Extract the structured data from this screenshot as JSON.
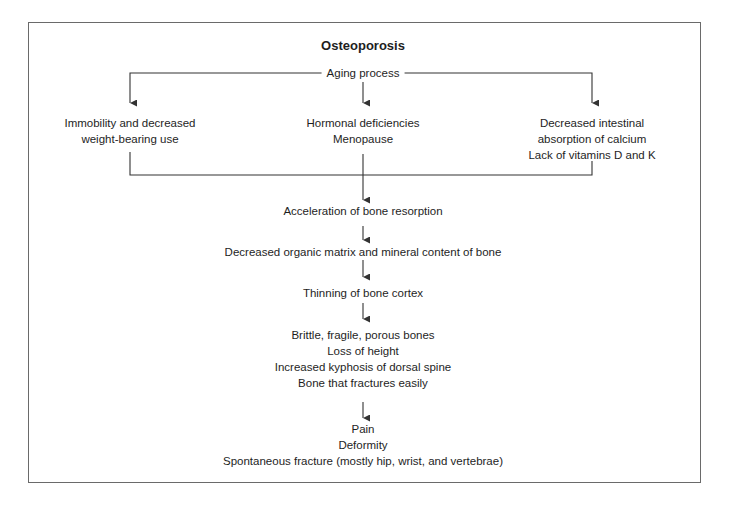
{
  "diagram": {
    "title": "Osteoporosis",
    "root": "Aging process",
    "causes": [
      {
        "lines": [
          "Immobility and decreased",
          "weight-bearing use"
        ]
      },
      {
        "lines": [
          "Hormonal deficiencies",
          "Menopause"
        ]
      },
      {
        "lines": [
          "Decreased intestinal",
          "absorption of calcium",
          "Lack of vitamins D and K"
        ]
      }
    ],
    "chain": [
      {
        "lines": [
          "Acceleration of bone resorption"
        ]
      },
      {
        "lines": [
          "Decreased organic matrix and mineral content of bone"
        ]
      },
      {
        "lines": [
          "Thinning of bone cortex"
        ]
      },
      {
        "lines": [
          "Brittle, fragile, porous bones",
          "Loss of height",
          "Increased kyphosis of dorsal spine",
          "Bone that fractures easily"
        ]
      },
      {
        "lines": [
          "Pain",
          "Deformity",
          "Spontaneous fracture (mostly hip, wrist, and vertebrae)"
        ]
      }
    ],
    "colors": {
      "line": "#333333",
      "frame": "#6a6a6a",
      "text": "#1e1e1e"
    }
  }
}
